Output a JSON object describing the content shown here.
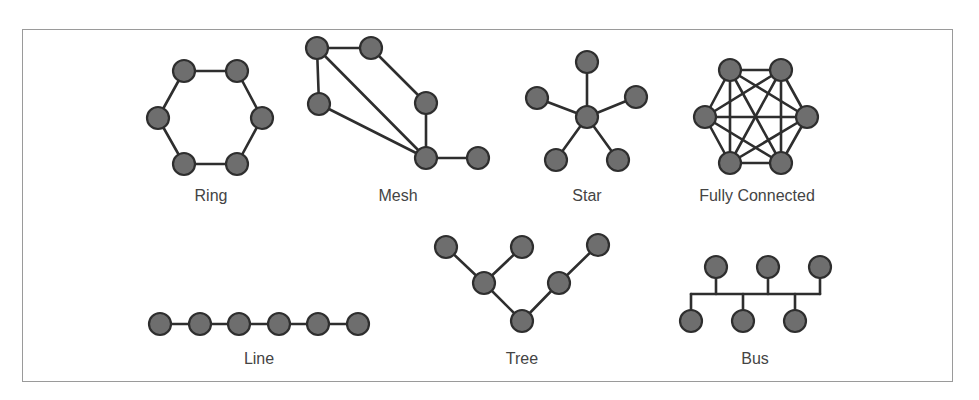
{
  "figure": {
    "frame": {
      "x": 22,
      "y": 29,
      "width": 931,
      "height": 353
    },
    "colors": {
      "node_fill": "#6e6e6e",
      "node_stroke": "#2e2e2e",
      "edge": "#2e2e2e",
      "label": "#444444",
      "frame": "#9a9a9a"
    },
    "node_radius": 11
  },
  "topologies": {
    "ring": {
      "label": "Ring",
      "label_pos": [
        211,
        201
      ],
      "nodes": [
        [
          184,
          71
        ],
        [
          237,
          71
        ],
        [
          262,
          118
        ],
        [
          237,
          164
        ],
        [
          184,
          164
        ],
        [
          158,
          118
        ]
      ],
      "edges": [
        [
          0,
          1
        ],
        [
          1,
          2
        ],
        [
          2,
          3
        ],
        [
          3,
          4
        ],
        [
          4,
          5
        ],
        [
          5,
          0
        ]
      ]
    },
    "mesh": {
      "label": "Mesh",
      "label_pos": [
        398,
        201
      ],
      "nodes": [
        [
          317,
          48
        ],
        [
          371,
          48
        ],
        [
          319,
          104
        ],
        [
          426,
          103
        ],
        [
          426,
          158
        ],
        [
          478,
          158
        ]
      ],
      "edges": [
        [
          0,
          1
        ],
        [
          0,
          2
        ],
        [
          0,
          4
        ],
        [
          1,
          3
        ],
        [
          2,
          4
        ],
        [
          3,
          4
        ],
        [
          4,
          5
        ]
      ]
    },
    "star": {
      "label": "Star",
      "label_pos": [
        587,
        201
      ],
      "nodes": [
        [
          587,
          117
        ],
        [
          587,
          62
        ],
        [
          537,
          98
        ],
        [
          636,
          97
        ],
        [
          556,
          160
        ],
        [
          618,
          160
        ]
      ],
      "edges": [
        [
          0,
          1
        ],
        [
          0,
          2
        ],
        [
          0,
          3
        ],
        [
          0,
          4
        ],
        [
          0,
          5
        ]
      ]
    },
    "fully_connected": {
      "label": "Fully Connected",
      "label_pos": [
        757,
        201
      ],
      "nodes": [
        [
          730,
          70
        ],
        [
          781,
          70
        ],
        [
          807,
          117
        ],
        [
          781,
          163
        ],
        [
          730,
          163
        ],
        [
          705,
          117
        ]
      ],
      "edges": [
        [
          0,
          1
        ],
        [
          0,
          2
        ],
        [
          0,
          3
        ],
        [
          0,
          4
        ],
        [
          0,
          5
        ],
        [
          1,
          2
        ],
        [
          1,
          3
        ],
        [
          1,
          4
        ],
        [
          1,
          5
        ],
        [
          2,
          3
        ],
        [
          2,
          4
        ],
        [
          2,
          5
        ],
        [
          3,
          4
        ],
        [
          3,
          5
        ],
        [
          4,
          5
        ]
      ]
    },
    "line": {
      "label": "Line",
      "label_pos": [
        259,
        364
      ],
      "nodes": [
        [
          160,
          324
        ],
        [
          200,
          324
        ],
        [
          239,
          324
        ],
        [
          279,
          324
        ],
        [
          318,
          324
        ],
        [
          358,
          324
        ]
      ],
      "edges": [
        [
          0,
          1
        ],
        [
          1,
          2
        ],
        [
          2,
          3
        ],
        [
          3,
          4
        ],
        [
          4,
          5
        ]
      ]
    },
    "tree": {
      "label": "Tree",
      "label_pos": [
        522,
        364
      ],
      "nodes": [
        [
          522,
          321
        ],
        [
          484,
          283
        ],
        [
          559,
          283
        ],
        [
          446,
          247
        ],
        [
          522,
          247
        ],
        [
          598,
          245
        ]
      ],
      "edges": [
        [
          0,
          1
        ],
        [
          0,
          2
        ],
        [
          1,
          3
        ],
        [
          1,
          4
        ],
        [
          2,
          5
        ]
      ]
    },
    "bus": {
      "label": "Bus",
      "label_pos": [
        755,
        364
      ],
      "bus_line": {
        "x1": 691,
        "x2": 820,
        "y": 294
      },
      "nodes": [
        [
          716,
          267
        ],
        [
          768,
          267
        ],
        [
          820,
          267
        ],
        [
          691,
          321
        ],
        [
          743,
          321
        ],
        [
          795,
          321
        ]
      ]
    }
  }
}
